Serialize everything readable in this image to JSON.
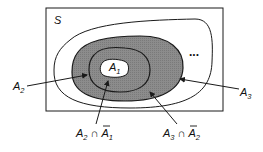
{
  "diagram": {
    "type": "nested-sets-venn",
    "universe_label": "S",
    "ellipsis": "...",
    "sets": [
      {
        "name": "A",
        "sub": "1",
        "fill": "#ffffff"
      },
      {
        "name": "A",
        "sub": "2",
        "fill": "#8a8a8a"
      },
      {
        "name": "A",
        "sub": "3",
        "fill": "#8a8a8a"
      }
    ],
    "labels": {
      "a2": {
        "base": "A",
        "sub": "2"
      },
      "a3": {
        "base": "A",
        "sub": "3"
      },
      "a2_minus_a1": {
        "left_base": "A",
        "left_sub": "2",
        "op": "∩",
        "right_base": "A",
        "right_sub": "1",
        "complement": true
      },
      "a3_minus_a2": {
        "left_base": "A",
        "left_sub": "3",
        "op": "∩",
        "right_base": "A",
        "right_sub": "2",
        "complement": true
      }
    },
    "colors": {
      "stroke": "#1a1a1a",
      "shade": "#8a8a8a",
      "background": "#ffffff"
    }
  }
}
